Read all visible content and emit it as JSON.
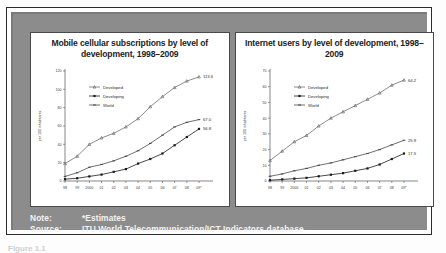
{
  "figure": {
    "note_label": "Note:",
    "note_value": "*Estimates",
    "source_label": "Source:",
    "source_value": "ITU World Telecommunication/ICT Indicators database",
    "caption_partial": "Figure 1.1"
  },
  "colors": {
    "mat": "#8c8c8c",
    "panel_bg": "#ffffff",
    "frame": "#2b2b2b",
    "series_developed": "#6e6e6e",
    "series_developing": "#1a1a1a",
    "series_world": "#4a4a4a"
  },
  "chart_data": [
    {
      "type": "line",
      "id": "mobile-cellular",
      "title": "Mobile cellular subscriptions by level of development, 1998–2009",
      "xlabel": "",
      "ylabel": "per 100 inhabitants",
      "ylim": [
        0,
        120
      ],
      "yticks": [
        0,
        20,
        40,
        60,
        80,
        100,
        120
      ],
      "grid": false,
      "legend_position": "upper-left",
      "categories": [
        "98",
        "99",
        "2000",
        "01",
        "02",
        "03",
        "04",
        "05",
        "06",
        "07",
        "08",
        "09*"
      ],
      "series": [
        {
          "name": "Developed",
          "values": [
            19.0,
            27.0,
            40.0,
            47.0,
            52.0,
            59.0,
            68.0,
            81.0,
            92.0,
            102.0,
            109.0,
            113.6
          ],
          "end_label": "113.6"
        },
        {
          "name": "World",
          "values": [
            5.0,
            9.0,
            15.0,
            18.0,
            22.0,
            27.0,
            33.0,
            41.0,
            50.0,
            59.0,
            64.0,
            67.0
          ],
          "end_label": "67.0"
        },
        {
          "name": "Developing",
          "values": [
            2.0,
            3.0,
            5.0,
            7.0,
            10.0,
            13.0,
            19.0,
            24.0,
            30.0,
            39.0,
            48.0,
            56.8
          ],
          "end_label": "56.8"
        }
      ]
    },
    {
      "type": "line",
      "id": "internet-users",
      "title": "Internet users by level of development, 1998–2009",
      "xlabel": "",
      "ylabel": "per 100 inhabitants",
      "ylim": [
        0,
        70
      ],
      "yticks": [
        0,
        10,
        20,
        30,
        40,
        50,
        60,
        70
      ],
      "grid": false,
      "legend_position": "upper-left",
      "categories": [
        "98",
        "99",
        "2000",
        "01",
        "02",
        "03",
        "04",
        "05",
        "06",
        "07",
        "08",
        "09*"
      ],
      "series": [
        {
          "name": "Developed",
          "values": [
            13.0,
            19.0,
            25.0,
            29.0,
            35.0,
            40.0,
            44.0,
            48.0,
            52.0,
            56.0,
            61.0,
            64.2
          ],
          "end_label": "64.2"
        },
        {
          "name": "World",
          "values": [
            3.0,
            4.5,
            6.5,
            8.0,
            10.0,
            11.5,
            13.5,
            15.5,
            17.5,
            20.0,
            23.0,
            25.9
          ],
          "end_label": "25.9"
        },
        {
          "name": "Developing",
          "values": [
            0.5,
            1.0,
            1.5,
            2.0,
            3.0,
            4.0,
            5.0,
            6.5,
            8.0,
            10.5,
            14.0,
            17.5
          ],
          "end_label": "17.5"
        }
      ]
    }
  ]
}
